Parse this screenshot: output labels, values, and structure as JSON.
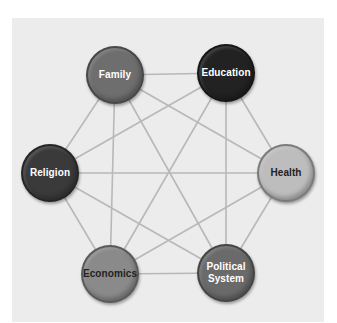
{
  "diagram": {
    "nodes": [
      {
        "id": "family",
        "label": "Family",
        "cx": 115,
        "cy": 75,
        "fill": "#6e6e6e",
        "text_color": "#ffffff"
      },
      {
        "id": "education",
        "label": "Education",
        "cx": 226,
        "cy": 73,
        "fill": "#222222",
        "text_color": "#ffffff"
      },
      {
        "id": "religion",
        "label": "Religion",
        "cx": 50,
        "cy": 173,
        "fill": "#3a3a3a",
        "text_color": "#ffffff"
      },
      {
        "id": "health",
        "label": "Health",
        "cx": 286,
        "cy": 173,
        "fill": "#bdbdbd",
        "text_color": "#222222"
      },
      {
        "id": "economics",
        "label": "Economics",
        "cx": 110,
        "cy": 274,
        "fill": "#8a8a8a",
        "text_color": "#222222"
      },
      {
        "id": "political",
        "label": "Political System",
        "cx": 226,
        "cy": 273,
        "fill": "#6a6a6a",
        "text_color": "#ffffff"
      }
    ],
    "line_color": "#b8b8b8",
    "panel_color": "#ececec"
  }
}
